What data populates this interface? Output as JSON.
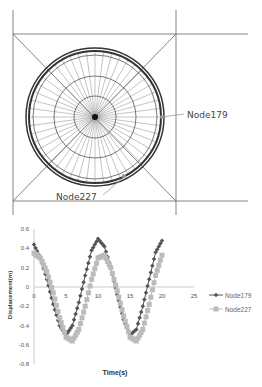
{
  "diagram": {
    "labels": [
      {
        "text": "Node179",
        "x": 187,
        "y": 118
      },
      {
        "text": "Node227",
        "x": 56,
        "y": 200
      }
    ]
  },
  "chart_data": {
    "type": "line",
    "title": "",
    "xlabel": "Time(s)",
    "ylabel": "Displacement(m)",
    "xlim": [
      0,
      25
    ],
    "ylim": [
      -0.8,
      0.6
    ],
    "xticks": [
      0,
      5,
      10,
      15,
      20,
      25
    ],
    "yticks": [
      0.6,
      0.4,
      0.2,
      0,
      -0.2,
      -0.4,
      -0.6,
      -0.8
    ],
    "grid": false,
    "legend_position": "right",
    "series": [
      {
        "name": "Node179",
        "color": "#555555",
        "marker": "diamond",
        "x": [
          0,
          1,
          2,
          3,
          4,
          5,
          6,
          7,
          8,
          9,
          10,
          11,
          12,
          13,
          14,
          15,
          16,
          17,
          18,
          19,
          20
        ],
        "values": [
          0.44,
          0.3,
          0.08,
          -0.18,
          -0.4,
          -0.5,
          -0.4,
          -0.16,
          0.12,
          0.38,
          0.5,
          0.42,
          0.2,
          -0.08,
          -0.34,
          -0.5,
          -0.44,
          -0.2,
          0.08,
          0.36,
          0.48
        ]
      },
      {
        "name": "Node227",
        "color": "#bbbbbb",
        "marker": "square",
        "x": [
          0,
          1,
          2,
          3,
          4,
          5,
          6,
          7,
          8,
          9,
          10,
          11,
          12,
          13,
          14,
          15,
          16,
          17,
          18,
          19,
          20
        ],
        "values": [
          0.35,
          0.3,
          0.16,
          -0.06,
          -0.32,
          -0.52,
          -0.56,
          -0.44,
          -0.2,
          0.08,
          0.3,
          0.33,
          0.2,
          -0.04,
          -0.3,
          -0.52,
          -0.56,
          -0.44,
          -0.18,
          0.12,
          0.33
        ]
      }
    ]
  }
}
